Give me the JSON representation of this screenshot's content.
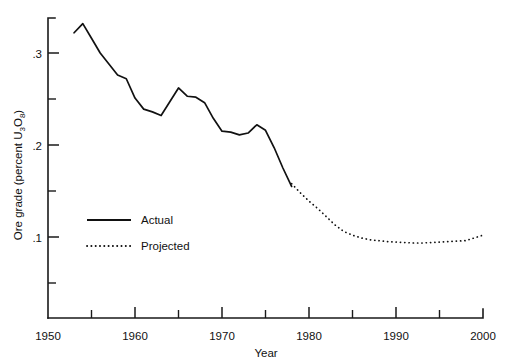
{
  "chart_data": {
    "type": "line",
    "title": "",
    "xlabel": "Year",
    "ylabel": "Ore grade (percent U3O8)",
    "ylabel_parts": {
      "prefix": "Ore grade (percent U",
      "sub1": "3",
      "mid": "O",
      "sub2": "8",
      "suffix": ")"
    },
    "xlim": [
      1950,
      2000
    ],
    "ylim": [
      0,
      0.335
    ],
    "grid": false,
    "legend_position": "inside-left",
    "x_ticks_major": [
      1950,
      1960,
      1970,
      1980,
      1990,
      2000
    ],
    "x_tick_labels": [
      "1950",
      "1960",
      "1970",
      "1980",
      "1990",
      "2000"
    ],
    "x_ticks_minor": [
      1955,
      1965,
      1975,
      1985,
      1995
    ],
    "y_ticks_major": [
      0.1,
      0.2,
      0.3
    ],
    "y_tick_labels": [
      ".1",
      ".2",
      ".3"
    ],
    "y_ticks_minor": [
      0.05,
      0.15,
      0.25
    ],
    "series": [
      {
        "name": "Actual",
        "style": "solid",
        "x": [
          1953,
          1954,
          1955,
          1956,
          1957,
          1958,
          1959,
          1960,
          1961,
          1962,
          1963,
          1964,
          1965,
          1966,
          1967,
          1968,
          1969,
          1970,
          1971,
          1972,
          1973,
          1974,
          1975,
          1976,
          1977,
          1978
        ],
        "values": [
          0.322,
          0.332,
          0.316,
          0.3,
          0.288,
          0.276,
          0.272,
          0.251,
          0.239,
          0.236,
          0.232,
          0.247,
          0.262,
          0.253,
          0.252,
          0.246,
          0.229,
          0.215,
          0.214,
          0.211,
          0.213,
          0.222,
          0.216,
          0.197,
          0.175,
          0.155
        ]
      },
      {
        "name": "Projected",
        "style": "dotted",
        "x": [
          1978,
          1979,
          1980,
          1981,
          1982,
          1983,
          1984,
          1985,
          1986,
          1987,
          1988,
          1989,
          1990,
          1991,
          1992,
          1993,
          1994,
          1995,
          1996,
          1997,
          1998,
          1999,
          2000
        ],
        "values": [
          0.158,
          0.148,
          0.139,
          0.131,
          0.122,
          0.113,
          0.106,
          0.102,
          0.099,
          0.097,
          0.096,
          0.095,
          0.0945,
          0.094,
          0.0935,
          0.0935,
          0.094,
          0.0945,
          0.095,
          0.0955,
          0.096,
          0.099,
          0.102
        ]
      }
    ],
    "legend": [
      {
        "label": "Actual",
        "style": "solid"
      },
      {
        "label": "Projected",
        "style": "dotted"
      }
    ]
  }
}
